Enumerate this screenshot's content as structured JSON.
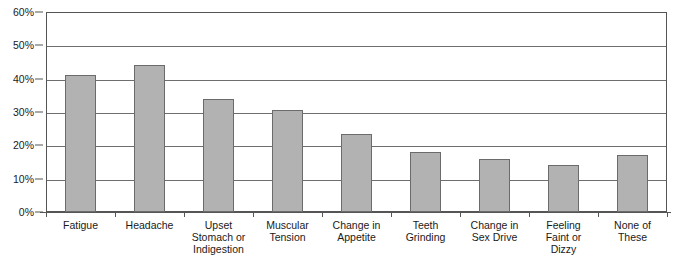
{
  "chart_data": {
    "type": "bar",
    "title": "",
    "xlabel": "",
    "ylabel": "",
    "categories": [
      "Fatigue",
      "Upset Stomach or Indigestion",
      "Headache",
      "Muscular Tension",
      "Change in Appetite",
      "Teeth Grinding",
      "Change in Sex Drive",
      "Feeling Faint or Dizzy",
      "None of These"
    ],
    "category_lines": [
      [
        "Fatigue"
      ],
      [
        "Headache"
      ],
      [
        "Upset",
        "Stomach or",
        "Indigestion"
      ],
      [
        "Muscular",
        "Tension"
      ],
      [
        "Change in",
        "Appetite"
      ],
      [
        "Teeth",
        "Grinding"
      ],
      [
        "Change in",
        "Sex Drive"
      ],
      [
        "Feeling",
        "Faint or",
        "Dizzy"
      ],
      [
        "None of",
        "These"
      ]
    ],
    "ordered_categories": [
      "Fatigue",
      "Headache",
      "Upset Stomach or Indigestion",
      "Muscular Tension",
      "Change in Appetite",
      "Teeth Grinding",
      "Change in Sex Drive",
      "Feeling Faint or Dizzy",
      "None of These"
    ],
    "values": [
      41,
      44,
      34,
      30.5,
      23.5,
      18,
      16,
      14,
      17
    ],
    "ylim": [
      0,
      60
    ],
    "ytick_values": [
      0,
      10,
      20,
      30,
      40,
      50,
      60
    ],
    "ytick_labels": [
      "0%",
      "10%",
      "20%",
      "30%",
      "40%",
      "50%",
      "60%"
    ],
    "grid": true,
    "grid_axis": "y",
    "legend": false,
    "bar_color": "#b2b2b2",
    "bar_border_color": "#6b6b6b",
    "axis_color": "#555555",
    "gridline_color": "#6e6e6e",
    "background_color": "#ffffff"
  }
}
